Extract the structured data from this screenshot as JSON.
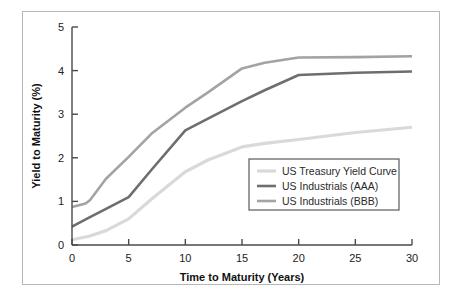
{
  "chart_data": {
    "type": "line",
    "title": "",
    "xlabel": "Time to Maturity (Years)",
    "ylabel": "Yield to Maturity (%)",
    "xlim": [
      0,
      30
    ],
    "ylim": [
      0,
      5
    ],
    "xticks": [
      "0",
      "5",
      "10",
      "15",
      "20",
      "25",
      "30"
    ],
    "yticks": [
      "0",
      "1",
      "2",
      "3",
      "4",
      "5"
    ],
    "grid": false,
    "legend_position": "lower-right-inside",
    "series": [
      {
        "name": "US Treasury Yield Curve",
        "color": "#d9d9d9",
        "x": [
          0,
          1.5,
          3,
          5,
          7,
          10,
          12,
          15,
          17,
          20,
          25,
          30
        ],
        "values": [
          0.12,
          0.2,
          0.33,
          0.6,
          1.05,
          1.68,
          1.95,
          2.25,
          2.33,
          2.42,
          2.58,
          2.7
        ]
      },
      {
        "name": "US Industrials (AAA)",
        "color": "#6e6e6e",
        "x": [
          0,
          1.5,
          3,
          5,
          7,
          10,
          12,
          15,
          17,
          20,
          25,
          30
        ],
        "values": [
          0.42,
          0.63,
          0.83,
          1.1,
          1.72,
          2.63,
          2.9,
          3.3,
          3.55,
          3.9,
          3.95,
          3.98
        ]
      },
      {
        "name": "US Industrials (BBB)",
        "color": "#a3a3a3",
        "x": [
          0,
          1.2,
          1.6,
          3,
          5,
          7,
          10,
          12,
          15,
          17,
          20,
          25,
          30
        ],
        "values": [
          0.87,
          0.95,
          1.03,
          1.52,
          2.02,
          2.55,
          3.15,
          3.5,
          4.05,
          4.18,
          4.3,
          4.31,
          4.33
        ]
      }
    ]
  },
  "legend": {
    "items": [
      {
        "label": "US Treasury Yield Curve"
      },
      {
        "label": "US Industrials (AAA)"
      },
      {
        "label": "US Industrials (BBB)"
      }
    ]
  }
}
